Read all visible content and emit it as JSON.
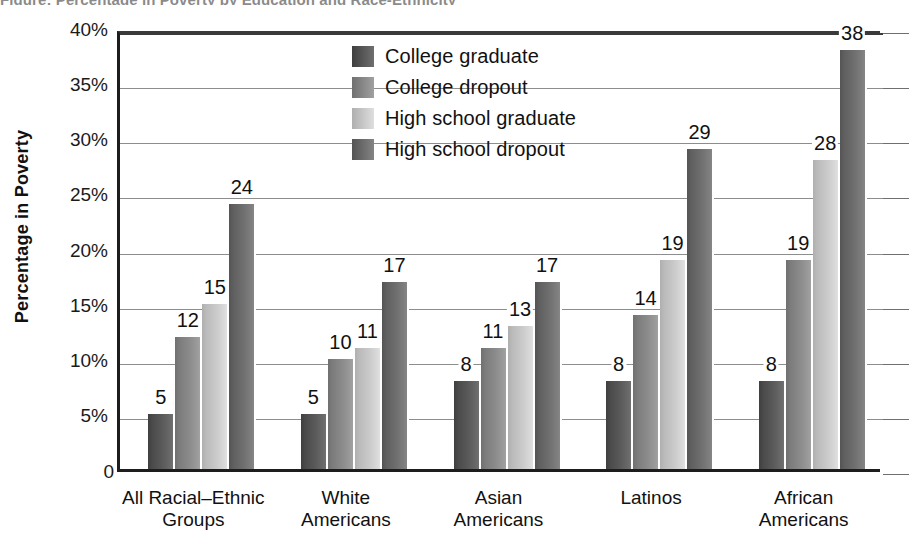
{
  "title_sliver": "Figure: Percentage in Poverty by Education and Race-Ethnicity",
  "chart_data": {
    "type": "bar",
    "title": "",
    "xlabel": "",
    "ylabel": "Percentage in Poverty",
    "ylim": [
      0,
      40
    ],
    "ytick_values": [
      0,
      5,
      10,
      15,
      20,
      25,
      30,
      35,
      40
    ],
    "ytick_labels": [
      "0",
      "5%",
      "10%",
      "15%",
      "20%",
      "25%",
      "30%",
      "35%",
      "40%"
    ],
    "grid": true,
    "legend_position": "inside-top-center",
    "value_labels": true,
    "categories": [
      "All Racial–Ethnic\nGroups",
      "White\nAmericans",
      "Asian\nAmericans",
      "Latinos",
      "African\nAmericans"
    ],
    "series": [
      {
        "name": "College graduate",
        "color": "#595959",
        "values": [
          5,
          5,
          8,
          8,
          8
        ]
      },
      {
        "name": "College dropout",
        "color": "#8a8a8a",
        "values": [
          12,
          10,
          11,
          14,
          19
        ]
      },
      {
        "name": "High school graduate",
        "color": "#c9c9c9",
        "values": [
          15,
          11,
          13,
          19,
          28
        ]
      },
      {
        "name": "High school dropout",
        "color": "#6e6e6e",
        "values": [
          24,
          17,
          17,
          29,
          38
        ]
      }
    ]
  }
}
